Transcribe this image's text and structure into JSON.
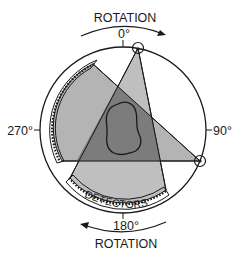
{
  "diagram": {
    "labels": {
      "rotation_top": "ROTATION",
      "rotation_bottom": "ROTATION",
      "angle_0": "0°",
      "angle_90": "90°",
      "angle_180": "180°",
      "angle_270": "270°",
      "detectors": "DETECTORS"
    },
    "elements": [
      {
        "name": "gantry-circle",
        "type": "circle",
        "center": [
          123,
          130
        ],
        "radius": 83
      },
      {
        "name": "source-0",
        "type": "x-ray-source",
        "position": [
          138,
          48
        ]
      },
      {
        "name": "source-90",
        "type": "x-ray-source",
        "position": [
          200,
          161
        ]
      },
      {
        "name": "beam-from-top-source",
        "type": "fan-beam",
        "from": "source-0",
        "to": "bottom-detector-arc"
      },
      {
        "name": "beam-from-right-source",
        "type": "fan-beam",
        "from": "source-90",
        "to": "left-detector-arc"
      },
      {
        "name": "bottom-detector-arc",
        "type": "detector-array"
      },
      {
        "name": "left-detector-arc",
        "type": "detector-array"
      },
      {
        "name": "object",
        "type": "irregular-outline",
        "location": "center overlap region"
      },
      {
        "name": "rotation-arrow-top",
        "type": "arrow",
        "direction": "clockwise"
      },
      {
        "name": "rotation-arrow-bottom",
        "type": "arrow",
        "direction": "clockwise"
      }
    ],
    "colors": {
      "beam_fill": "#b4b4b4",
      "overlap_fill": "#7c7c7c",
      "stroke": "#1a1a1a",
      "background": "#ffffff"
    }
  }
}
